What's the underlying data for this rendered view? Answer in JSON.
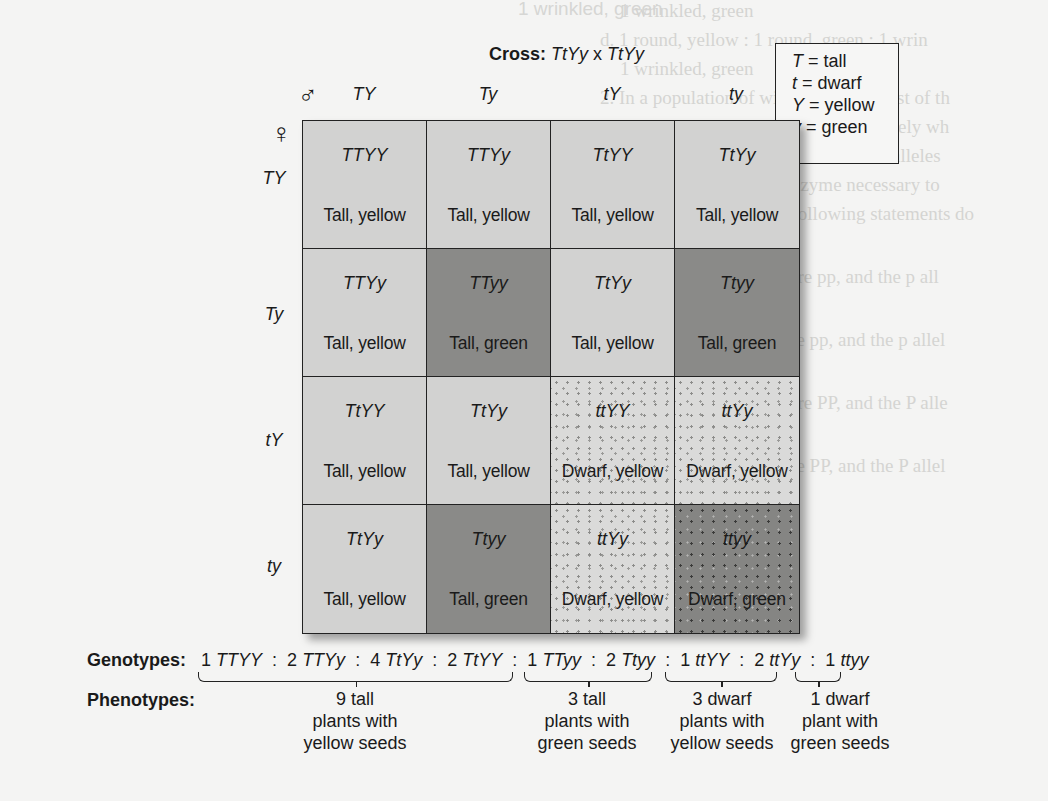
{
  "background_bleed_text": {
    "left_column": [
      "1 wrinkled, green",
      "d. 1 round, yellow : 1 round, green : 1 wrin",
      "1 wrinkled, green",
      "2. In a population of wild squirrels, most of th",
      "but an occasional squirrel is completely wh",
      "P represent dominant and recessive alleles",
      "gene that encodes an enzyme necessary to",
      "pigment, which of the following statements do",
      "likely to be correct?",
      "a. The white squirrels are pp, and the p all",
      "functional allele.",
      "b. The gray squirrels are pp, and the p allel",
      "functional allele.",
      "c. The white squirrels are PP, and the P alle",
      "functional allele.",
      "d. The gray squirrels are PP, and the P allel",
      "functional allele."
    ],
    "right_column": [
      "in pea plants was critically important because",
      "itance pattern in most eukaryotic organisms",
      "true for earthworms, mice, humans and",
      "ears many organisms through sexual reproduction",
      "ctical studies, many researchers focus",
      "tion on the relationship between the molecu",
      "genes and the phenotypes of individuals",
      "ecur throughout the textbook, we will",
      "by designating certain genes as essential",
      "shell. As mentioned in chapter 1, most genes",
      "at function within living cells",
      "al proteins affects the traits",
      "tic approach can help us",
      "proteins function and",
      "geneticist will try to identify",
      "s of a gene to see how",
      "nism. These defective genes",
      "d they provide genetic",
      "tekingly, Gregor Mendel",
      "eles among his strains",
      "in pea plants he studied",
      "by a mutation which are often identified",
      "ver, though, in most cases",
      "ss-of-function alleles are effective",
      "provide critical clues concerning the purpose"
    ],
    "bottom_left": [
      "Learning Outcomes:",
      "1. Describe the features of a pedigree"
    ]
  },
  "cross": {
    "label": "Cross:",
    "parent1": "TtYy",
    "operator": "x",
    "parent2": "TtYy"
  },
  "legend": {
    "items": [
      {
        "symbol": "T",
        "meaning": "= tall"
      },
      {
        "symbol": "t",
        "meaning": "= dwarf"
      },
      {
        "symbol": "Y",
        "meaning": "= yellow"
      },
      {
        "symbol": "y",
        "meaning": "= green"
      }
    ]
  },
  "punnett": {
    "male_symbol": "♂",
    "female_symbol": "♀",
    "male_gametes": [
      "TY",
      "Ty",
      "tY",
      "ty"
    ],
    "female_gametes": [
      "TY",
      "Ty",
      "tY",
      "ty"
    ],
    "cells": [
      [
        {
          "genotype": "TTYY",
          "phenotype": "Tall, yellow",
          "class": "tall-yellow"
        },
        {
          "genotype": "TTYy",
          "phenotype": "Tall, yellow",
          "class": "tall-yellow"
        },
        {
          "genotype": "TtYY",
          "phenotype": "Tall, yellow",
          "class": "tall-yellow"
        },
        {
          "genotype": "TtYy",
          "phenotype": "Tall, yellow",
          "class": "tall-yellow"
        }
      ],
      [
        {
          "genotype": "TTYy",
          "phenotype": "Tall, yellow",
          "class": "tall-yellow"
        },
        {
          "genotype": "TTyy",
          "phenotype": "Tall, green",
          "class": "tall-green"
        },
        {
          "genotype": "TtYy",
          "phenotype": "Tall, yellow",
          "class": "tall-yellow"
        },
        {
          "genotype": "Ttyy",
          "phenotype": "Tall, green",
          "class": "tall-green"
        }
      ],
      [
        {
          "genotype": "TtYY",
          "phenotype": "Tall, yellow",
          "class": "tall-yellow"
        },
        {
          "genotype": "TtYy",
          "phenotype": "Tall, yellow",
          "class": "tall-yellow"
        },
        {
          "genotype": "ttYY",
          "phenotype": "Dwarf, yellow",
          "class": "dwarf-yellow"
        },
        {
          "genotype": "ttYy",
          "phenotype": "Dwarf, yellow",
          "class": "dwarf-yellow"
        }
      ],
      [
        {
          "genotype": "TtYy",
          "phenotype": "Tall, yellow",
          "class": "tall-yellow"
        },
        {
          "genotype": "Ttyy",
          "phenotype": "Tall, green",
          "class": "tall-green"
        },
        {
          "genotype": "ttYy",
          "phenotype": "Dwarf, yellow",
          "class": "dwarf-yellow"
        },
        {
          "genotype": "ttyy",
          "phenotype": "Dwarf, green",
          "class": "dwarf-green"
        }
      ]
    ],
    "fill_colors": {
      "tall_yellow": "#d2d2d1",
      "tall_green": "#8a8a88",
      "dwarf_yellow": "#dadad9 (stippled)",
      "dwarf_green": "#858583 (stippled)"
    }
  },
  "summary": {
    "genotypes_label": "Genotypes:",
    "phenotypes_label": "Phenotypes:",
    "genotypes": [
      {
        "count": "1",
        "genotype": "TTYY"
      },
      {
        "count": "2",
        "genotype": "TTYy"
      },
      {
        "count": "4",
        "genotype": "TtYy"
      },
      {
        "count": "2",
        "genotype": "TtYY"
      },
      {
        "count": "1",
        "genotype": "TTyy"
      },
      {
        "count": "2",
        "genotype": "Ttyy"
      },
      {
        "count": "1",
        "genotype": "ttYY"
      },
      {
        "count": "2",
        "genotype": "ttYy"
      },
      {
        "count": "1",
        "genotype": "ttyy"
      }
    ],
    "separator": ":",
    "phenotype_groups": [
      {
        "lines": [
          "9 tall",
          "plants with",
          "yellow seeds"
        ]
      },
      {
        "lines": [
          "3 tall",
          "plants with",
          "green seeds"
        ]
      },
      {
        "lines": [
          "3 dwarf",
          "plants with",
          "yellow seeds"
        ]
      },
      {
        "lines": [
          "1 dwarf",
          "plant with",
          "green seeds"
        ]
      }
    ],
    "ratio": "9:3:3:1"
  }
}
